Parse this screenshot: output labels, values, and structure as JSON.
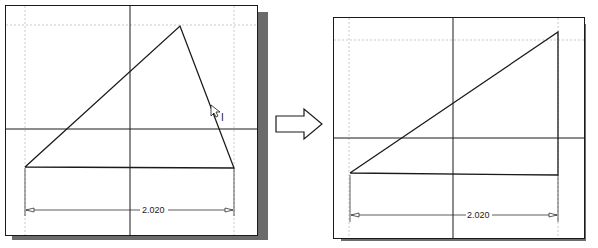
{
  "left_panel": {
    "label": "before",
    "dimension": "2.020",
    "cursor_label": "I"
  },
  "right_panel": {
    "label": "after",
    "dimension": "2.020"
  },
  "arrow": {
    "direction": "right"
  },
  "colors": {
    "line": "#1a1a1a",
    "grid": "#bdbdbd",
    "shadow": "#6b6b6b"
  }
}
